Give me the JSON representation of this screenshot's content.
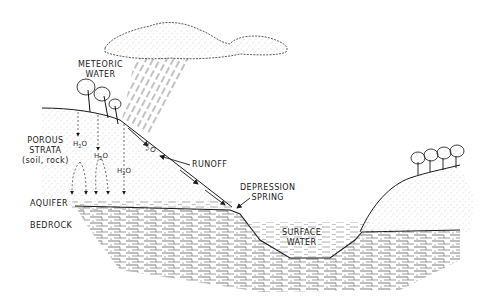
{
  "labels": {
    "meteoric_water": [
      "METEORIC",
      "WATER"
    ],
    "porous_strata": [
      "POROUS",
      "STRATA"
    ],
    "porous_strata_note": "(soil, rock)",
    "runoff": "RUNOFF",
    "depression_spring": [
      "DEPRESSION",
      "SPRING"
    ],
    "aquifer": "AQUIFER",
    "bedrock": "BEDROCK",
    "surface_water": [
      "SURFACE",
      "WATER"
    ]
  },
  "h2o_markers": [
    {
      "text": "H",
      "sub": "2",
      "tail": "O"
    },
    {
      "text": "H",
      "sub": "2",
      "tail": "O"
    },
    {
      "text": "H",
      "sub": "2",
      "tail": "O"
    },
    {
      "text": "H",
      "sub": "2",
      "tail": "O"
    }
  ],
  "colors": {
    "ink": "#1a1a1a",
    "stipple": "#888888",
    "background": "#ffffff"
  }
}
